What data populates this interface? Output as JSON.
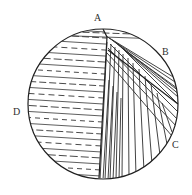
{
  "figure": {
    "kind": "hatched-circle-diagram",
    "title": "",
    "background_color": "#ffffff",
    "stroke_color": "#2b2b2b",
    "outline": {
      "shape": "circle",
      "center_x": 103,
      "center_y": 104,
      "radius": 75,
      "stroke_width": 1.1
    },
    "labels": [
      {
        "id": "A",
        "text": "A",
        "x": 94,
        "y": 13,
        "position": "top"
      },
      {
        "id": "B",
        "text": "B",
        "x": 162,
        "y": 47,
        "position": "upper-right"
      },
      {
        "id": "C",
        "text": "C",
        "x": 172,
        "y": 140,
        "position": "lower-right"
      },
      {
        "id": "D",
        "text": "D",
        "x": 13,
        "y": 107,
        "position": "left"
      }
    ],
    "regions": [
      {
        "id": "D",
        "name": "left-region",
        "hatch": "horizontal",
        "hatch_angle_deg": 4,
        "line_spacing_px": 6,
        "alternating_dashed": true,
        "description": "sub-horizontal lines, alternating solid and dashed"
      },
      {
        "id": "B",
        "name": "upper-right-region",
        "hatch": "diagonal",
        "hatch_angle_deg": 35,
        "line_spacing_px": 5,
        "alternating_dashed": false,
        "description": "fanning diagonal lines running NW to SE"
      },
      {
        "id": "C",
        "name": "lower-right-region",
        "hatch": "steep-diagonal",
        "hatch_angle_deg": 76,
        "line_spacing_px": 5,
        "alternating_dashed": false,
        "description": "steep near-vertical lines fanning toward lower right"
      },
      {
        "id": "A",
        "name": "top-region",
        "hatch": "horizontal",
        "hatch_angle_deg": 4,
        "line_spacing_px": 6,
        "alternating_dashed": true,
        "description": "narrow crescent at top with sub-horizontal dashed lines"
      }
    ],
    "boundaries": [
      {
        "name": "upper-boundary",
        "from_x": 103,
        "from_y": 29,
        "to_x": 107,
        "to_y": 37
      },
      {
        "name": "main-vertical-boundary",
        "from_x": 107,
        "from_y": 37,
        "to_x": 99,
        "to_y": 178
      },
      {
        "name": "fan-divider",
        "from_x": 108,
        "from_y": 50,
        "to_x": 178,
        "to_y": 104
      }
    ]
  }
}
